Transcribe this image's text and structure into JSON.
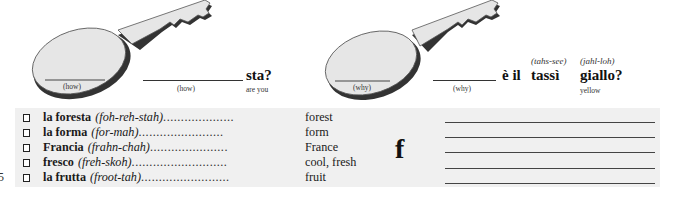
{
  "page_number": "5",
  "exercise": {
    "left": {
      "key_label": "(how)",
      "blank_hint": "(how)",
      "word": "sta?",
      "translation": "are you"
    },
    "right": {
      "key_label": "(why)",
      "blank_hint": "(why)",
      "phrase": "è il",
      "word1": "tassì",
      "word1_pron": "(tahs-see)",
      "word2": "giallo?",
      "word2_pron": "(jahl-loh)",
      "word2_translation": "yellow"
    }
  },
  "vocabulary": {
    "letter": "f",
    "items": [
      {
        "word": "la foresta",
        "pron": "(foh-reh-stah)",
        "dots": "....................",
        "meaning": "forest"
      },
      {
        "word": "la forma",
        "pron": "(for-mah)",
        "dots": "........................",
        "meaning": "form"
      },
      {
        "word": "Francia",
        "pron": "(frahn-chah)",
        "dots": "......................",
        "meaning": "France"
      },
      {
        "word": "fresco",
        "pron": "(freh-skoh)",
        "dots": "...........................",
        "meaning": "cool, fresh"
      },
      {
        "word": "la frutta",
        "pron": "(froot-tah)",
        "dots": ".........................",
        "meaning": "fruit"
      }
    ]
  },
  "colors": {
    "box_bg": "#f0f0f0",
    "key_fill": "#e6e6e6",
    "key_shadow": "#333333"
  }
}
